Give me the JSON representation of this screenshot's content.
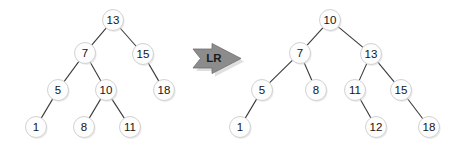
{
  "diagram": {
    "type": "binary-tree-rotation",
    "background_color": "#ffffff",
    "node_fill_color": "#fdfdfd",
    "node_stroke_color": "#d2d2d2",
    "edge_color": "#3a3a3a",
    "arrow_color": "#8c8c8c",
    "node_radius": 10.5
  },
  "arrow": {
    "label": "LR",
    "icon": "right-arrow-banner-icon",
    "direction": "right"
  },
  "left_tree": {
    "name": "before-rotation-tree",
    "root": "13",
    "nodes": [
      {
        "id": "n13",
        "label": "13",
        "x": 113,
        "y": 20
      },
      {
        "id": "n7",
        "label": "7",
        "x": 85,
        "y": 53
      },
      {
        "id": "n15",
        "label": "15",
        "x": 143,
        "y": 54
      },
      {
        "id": "n5",
        "label": "5",
        "x": 58,
        "y": 90
      },
      {
        "id": "n10",
        "label": "10",
        "x": 106,
        "y": 90
      },
      {
        "id": "n18",
        "label": "18",
        "x": 164,
        "y": 90
      },
      {
        "id": "n1",
        "label": "1",
        "x": 36,
        "y": 127
      },
      {
        "id": "n8",
        "label": "8",
        "x": 84,
        "y": 127
      },
      {
        "id": "n11",
        "label": "11",
        "x": 130,
        "y": 127
      }
    ],
    "edges": [
      {
        "from": "n13",
        "to": "n7",
        "side": "left"
      },
      {
        "from": "n13",
        "to": "n15",
        "side": "right"
      },
      {
        "from": "n7",
        "to": "n5",
        "side": "left"
      },
      {
        "from": "n7",
        "to": "n10",
        "side": "right"
      },
      {
        "from": "n15",
        "to": "n18",
        "side": "right"
      },
      {
        "from": "n5",
        "to": "n1",
        "side": "left"
      },
      {
        "from": "n10",
        "to": "n8",
        "side": "left"
      },
      {
        "from": "n10",
        "to": "n11",
        "side": "right"
      }
    ]
  },
  "right_tree": {
    "name": "after-rotation-tree",
    "root": "10",
    "nodes": [
      {
        "id": "m10",
        "label": "10",
        "x": 330,
        "y": 20
      },
      {
        "id": "m7",
        "label": "7",
        "x": 300,
        "y": 53
      },
      {
        "id": "m13",
        "label": "13",
        "x": 371,
        "y": 54
      },
      {
        "id": "m5",
        "label": "5",
        "x": 262,
        "y": 90
      },
      {
        "id": "m8",
        "label": "8",
        "x": 316,
        "y": 90
      },
      {
        "id": "m11",
        "label": "11",
        "x": 355,
        "y": 90
      },
      {
        "id": "m15",
        "label": "15",
        "x": 401,
        "y": 90
      },
      {
        "id": "m1",
        "label": "1",
        "x": 240,
        "y": 127
      },
      {
        "id": "m12",
        "label": "12",
        "x": 376,
        "y": 127
      },
      {
        "id": "m18",
        "label": "18",
        "x": 429,
        "y": 127
      }
    ],
    "edges": [
      {
        "from": "m10",
        "to": "m7",
        "side": "left"
      },
      {
        "from": "m10",
        "to": "m13",
        "side": "right"
      },
      {
        "from": "m7",
        "to": "m5",
        "side": "left"
      },
      {
        "from": "m7",
        "to": "m8",
        "side": "right"
      },
      {
        "from": "m13",
        "to": "m11",
        "side": "left"
      },
      {
        "from": "m13",
        "to": "m15",
        "side": "right"
      },
      {
        "from": "m5",
        "to": "m1",
        "side": "left"
      },
      {
        "from": "m11",
        "to": "m12",
        "side": "right"
      },
      {
        "from": "m15",
        "to": "m18",
        "side": "right"
      }
    ]
  }
}
